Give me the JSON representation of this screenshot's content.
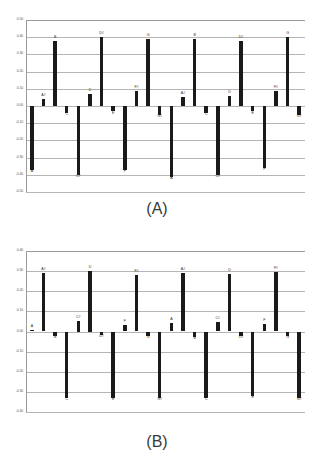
{
  "figure": {
    "panel_a": {
      "caption": "(A)",
      "caption_name": "panel-a-caption"
    },
    "panel_b": {
      "caption": "(B)",
      "caption_name": "panel-b-caption"
    }
  },
  "chart_data": [
    {
      "id": "panel-a",
      "type": "bar",
      "title": "(A)",
      "xlabel": "",
      "ylabel": "",
      "ylim": [
        -0.5,
        0.5
      ],
      "ytick_step": 0.1,
      "ytick_labels": [
        "0.50",
        "0.40",
        "0.30",
        "0.20",
        "0.10",
        "0.00",
        "-0.10",
        "-0.20",
        "-0.30",
        "-0.40",
        "-0.50"
      ],
      "ytick_values": [
        0.5,
        0.4,
        0.3,
        0.2,
        0.1,
        0.0,
        -0.1,
        -0.2,
        -0.3,
        -0.4,
        -0.5
      ],
      "grid": true,
      "legend": "none",
      "bar_color": "#1a1a1a",
      "categories": [
        "A",
        "A#",
        "B",
        "C",
        "C#",
        "D",
        "D#",
        "E",
        "F",
        "F#",
        "G",
        "G#",
        "A",
        "A#",
        "B",
        "C",
        "C#",
        "D",
        "D#",
        "E",
        "F",
        "F#",
        "G",
        "G#"
      ],
      "values": [
        -0.37,
        0.04,
        0.38,
        -0.04,
        -0.4,
        0.07,
        0.4,
        -0.03,
        -0.37,
        0.09,
        0.39,
        -0.05,
        -0.41,
        0.05,
        0.39,
        -0.04,
        -0.4,
        0.06,
        0.38,
        -0.03,
        -0.36,
        0.09,
        0.4,
        -0.05
      ]
    },
    {
      "id": "panel-b",
      "type": "bar",
      "title": "(B)",
      "xlabel": "",
      "ylabel": "",
      "ylim": [
        -0.4,
        0.4
      ],
      "ytick_step": 0.1,
      "ytick_labels": [
        "0.40",
        "0.30",
        "0.20",
        "0.10",
        "0.00",
        "-0.10",
        "-0.20",
        "-0.30",
        "-0.40"
      ],
      "ytick_values": [
        0.4,
        0.3,
        0.2,
        0.1,
        0.0,
        -0.1,
        -0.2,
        -0.3,
        -0.4
      ],
      "grid": true,
      "legend": "none",
      "bar_color": "#1a1a1a",
      "categories": [
        "A",
        "A#",
        "B",
        "C",
        "C#",
        "D",
        "D#",
        "E",
        "F",
        "F#",
        "G",
        "G#",
        "A",
        "A#",
        "B",
        "C",
        "C#",
        "D",
        "D#",
        "E",
        "F",
        "F#",
        "G",
        "G#"
      ],
      "values": [
        0.005,
        0.29,
        -0.02,
        -0.33,
        0.05,
        0.3,
        -0.015,
        -0.33,
        0.03,
        0.28,
        -0.02,
        -0.33,
        0.04,
        0.29,
        -0.025,
        -0.33,
        0.045,
        0.285,
        -0.02,
        -0.32,
        0.035,
        0.295,
        -0.02,
        -0.33
      ]
    }
  ]
}
